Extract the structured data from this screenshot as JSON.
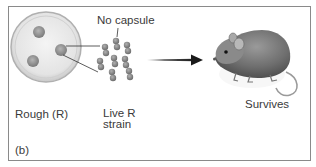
{
  "panel": {
    "id_label": "(b)",
    "callout": "No capsule",
    "dish_label": "Rough (R)",
    "strain_label_line1": "Live R",
    "strain_label_line2": "strain",
    "outcome_label": "Survives"
  },
  "icons": {
    "petri_dish": "petri-dish-icon",
    "bacteria": "bacteria-cluster-icon",
    "arrow": "arrow-right-icon",
    "mouse": "mouse-icon"
  },
  "colors": {
    "border": "#8a8a8a",
    "text": "#3a3a3a",
    "bacteria": "#8c8c8c",
    "arrow": "#222222"
  }
}
